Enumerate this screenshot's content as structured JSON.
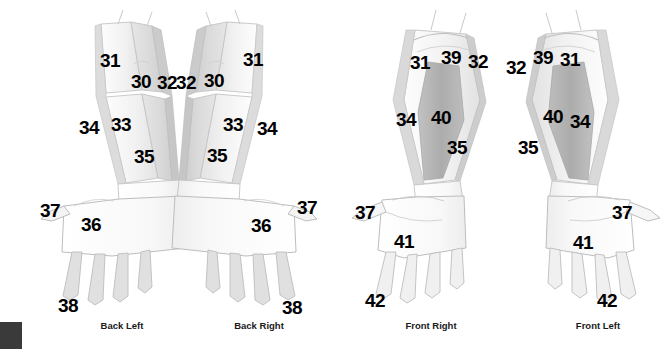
{
  "figure": {
    "background_color": "#ffffff",
    "label_color": "#000000"
  },
  "palette": {
    "outline": "#b9b9b9",
    "skin_light": "#fafafa",
    "band_light": "#e9e9e9",
    "band_mid": "#dcdcdc",
    "band_dark": "#b3b3b3",
    "band_darker": "#a9a9a9",
    "corner_swatch": "#3a3a3a"
  },
  "views": [
    {
      "id": "back-left",
      "caption": "Back Left",
      "caption_x": 122,
      "caption_y": 325,
      "labels": [
        {
          "text": "31",
          "x": 110,
          "y": 60
        },
        {
          "text": "30",
          "x": 141,
          "y": 81
        },
        {
          "text": "32",
          "x": 167,
          "y": 82
        },
        {
          "text": "34",
          "x": 89,
          "y": 127
        },
        {
          "text": "33",
          "x": 121,
          "y": 124
        },
        {
          "text": "35",
          "x": 144,
          "y": 156
        },
        {
          "text": "37",
          "x": 50,
          "y": 210
        },
        {
          "text": "36",
          "x": 91,
          "y": 224
        },
        {
          "text": "38",
          "x": 68,
          "y": 305
        }
      ]
    },
    {
      "id": "back-right",
      "caption": "Back Right",
      "caption_x": 259,
      "caption_y": 325,
      "labels": [
        {
          "text": "32",
          "x": 186,
          "y": 82
        },
        {
          "text": "30",
          "x": 214,
          "y": 80
        },
        {
          "text": "31",
          "x": 253,
          "y": 59
        },
        {
          "text": "33",
          "x": 233,
          "y": 124
        },
        {
          "text": "34",
          "x": 267,
          "y": 128
        },
        {
          "text": "35",
          "x": 217,
          "y": 155
        },
        {
          "text": "36",
          "x": 261,
          "y": 225
        },
        {
          "text": "37",
          "x": 307,
          "y": 207
        },
        {
          "text": "38",
          "x": 292,
          "y": 307
        }
      ]
    },
    {
      "id": "front-right",
      "caption": "Front Right",
      "caption_x": 431,
      "caption_y": 325,
      "labels": [
        {
          "text": "31",
          "x": 420,
          "y": 62
        },
        {
          "text": "39",
          "x": 451,
          "y": 57
        },
        {
          "text": "32",
          "x": 478,
          "y": 61
        },
        {
          "text": "34",
          "x": 406,
          "y": 119
        },
        {
          "text": "40",
          "x": 441,
          "y": 117
        },
        {
          "text": "35",
          "x": 457,
          "y": 147
        },
        {
          "text": "37",
          "x": 365,
          "y": 212
        },
        {
          "text": "41",
          "x": 404,
          "y": 241
        },
        {
          "text": "42",
          "x": 375,
          "y": 300
        }
      ]
    },
    {
      "id": "front-left",
      "caption": "Front Left",
      "caption_x": 598,
      "caption_y": 325,
      "labels": [
        {
          "text": "32",
          "x": 516,
          "y": 67
        },
        {
          "text": "39",
          "x": 543,
          "y": 57
        },
        {
          "text": "31",
          "x": 570,
          "y": 59
        },
        {
          "text": "40",
          "x": 553,
          "y": 116
        },
        {
          "text": "34",
          "x": 580,
          "y": 121
        },
        {
          "text": "35",
          "x": 528,
          "y": 147
        },
        {
          "text": "41",
          "x": 583,
          "y": 242
        },
        {
          "text": "37",
          "x": 622,
          "y": 212
        },
        {
          "text": "42",
          "x": 607,
          "y": 300
        }
      ]
    }
  ],
  "region_numbers": [
    "30",
    "31",
    "32",
    "33",
    "34",
    "35",
    "36",
    "37",
    "38",
    "39",
    "40",
    "41",
    "42"
  ],
  "corner_swatch": {
    "present": true,
    "color": "#3a3a3a"
  }
}
